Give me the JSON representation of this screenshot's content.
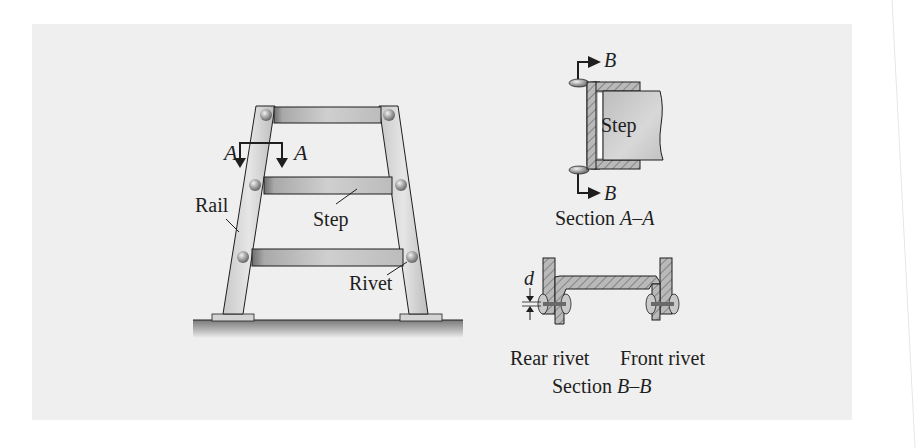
{
  "figure": {
    "colors": {
      "page": "#ffffff",
      "panel": "#efefef",
      "ink": "#1e1e1e",
      "metal_light": "#d9d9d9",
      "metal_mid": "#b5b5b5",
      "metal_dark": "#8a8a8a",
      "hatch": "#9a9a9a"
    }
  },
  "ladder_view": {
    "labels": {
      "rail": "Rail",
      "step": "Step",
      "rivet": "Rivet",
      "section_mark_left": "A",
      "section_mark_right": "A"
    }
  },
  "section_a": {
    "caption_prefix": "Section ",
    "caption_letters": "A–A",
    "step_label": "Step",
    "cut_mark_top": "B",
    "cut_mark_bottom": "B"
  },
  "section_b": {
    "caption_prefix": "Section ",
    "caption_letters": "B–B",
    "dimension_label": "d",
    "rear_rivet_label": "Rear rivet",
    "front_rivet_label": "Front rivet"
  }
}
